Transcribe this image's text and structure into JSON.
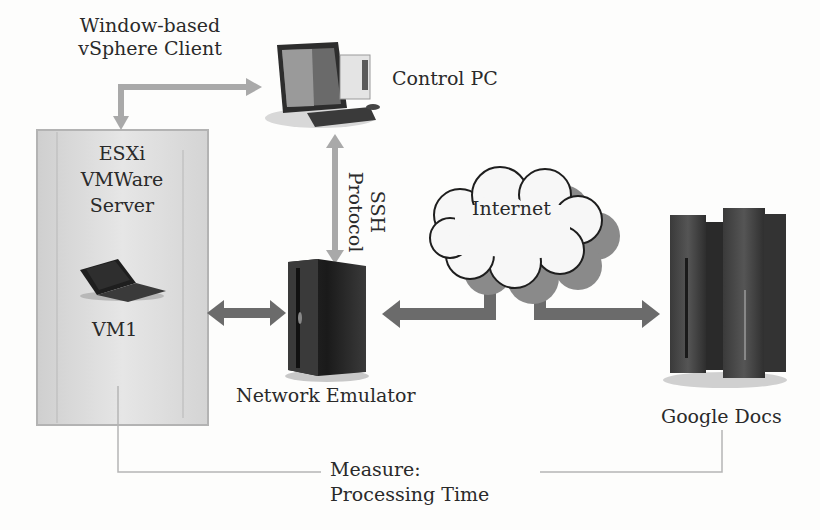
{
  "diagram": {
    "nodes": {
      "vsphere_client": {
        "line1": "Window-based",
        "line2": "vSphere Client"
      },
      "control_pc": {
        "label": "Control PC"
      },
      "esxi_server": {
        "line1": "ESXi",
        "line2": "VMWare",
        "line3": "Server"
      },
      "vm1": {
        "label": "VM1"
      },
      "network_emulator": {
        "label": "Network Emulator"
      },
      "internet": {
        "label": "Internet"
      },
      "google_docs": {
        "label": "Google Docs"
      }
    },
    "edges": {
      "ssh": {
        "line1": "SSH",
        "line2": "Protocol"
      },
      "measure": {
        "line1": "Measure:",
        "line2": "Processing Time"
      }
    },
    "colors": {
      "light_arrow": "#a9a9a9",
      "dark_arrow": "#6b6b6b",
      "server_box": "#dcdcdc",
      "cloud_shadow": "#8a8a8a",
      "cloud_fill": "#f7f7f7"
    }
  }
}
